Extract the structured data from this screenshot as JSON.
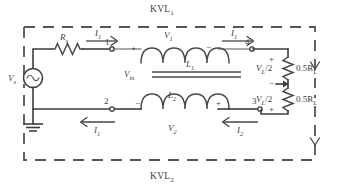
{
  "diagram": {
    "kvl_loops": [
      {
        "id": "kvl1",
        "label": "KVL",
        "subscript": "1",
        "position": "top"
      },
      {
        "id": "kvl2",
        "label": "KVL",
        "subscript": "2",
        "position": "bottom"
      }
    ],
    "source": {
      "label": "V",
      "subscript": "s",
      "symbol": "sine-wave-ac-source"
    },
    "resistors": [
      {
        "id": "rs",
        "label": "R",
        "subscript": "s",
        "position": "series-top-left"
      },
      {
        "id": "rload-top",
        "label": "0.5R",
        "subscript": "L",
        "position": "load-upper"
      },
      {
        "id": "rload-bottom",
        "label": "0.5R",
        "subscript": "L",
        "position": "load-lower"
      }
    ],
    "inductors": [
      {
        "id": "l1",
        "label": "L",
        "subscript": "1",
        "position": "primary"
      },
      {
        "id": "l2",
        "label": "L",
        "subscript": "2",
        "position": "secondary"
      }
    ],
    "voltages": [
      {
        "id": "v1",
        "label": "V",
        "subscript": "1",
        "plus": "+",
        "minus": "−"
      },
      {
        "id": "v2",
        "label": "V",
        "subscript": "2",
        "plus": "+",
        "minus": "−"
      },
      {
        "id": "vin",
        "label": "V",
        "subscript": "in"
      },
      {
        "id": "vl-top",
        "label": "V",
        "subscript": "L",
        "suffix": "/2",
        "plus": "+",
        "minus": "−"
      },
      {
        "id": "vl-bottom",
        "label": "V",
        "subscript": "L",
        "suffix": "/2",
        "plus": "+",
        "minus": "−"
      }
    ],
    "currents": [
      {
        "id": "i1-top-left",
        "label": "I",
        "subscript": "1",
        "direction": "right"
      },
      {
        "id": "i1-top-right",
        "label": "I",
        "subscript": "1",
        "direction": "right"
      },
      {
        "id": "i1-bottom-left",
        "label": "I",
        "subscript": "1",
        "direction": "left"
      },
      {
        "id": "i2-bottom-right",
        "label": "I",
        "subscript": "2",
        "direction": "left"
      }
    ],
    "nodes": [
      {
        "id": "n1",
        "label": "1"
      },
      {
        "id": "n2",
        "label": "2"
      },
      {
        "id": "n3",
        "label": "3"
      },
      {
        "id": "n4",
        "label": "4"
      }
    ],
    "ground": {
      "symbol": "earth-ground"
    },
    "colors": {
      "wire": "#3c3c44",
      "text": "#3b3b43",
      "dashed_loop": "#54545c",
      "background": "#ffffff"
    }
  }
}
